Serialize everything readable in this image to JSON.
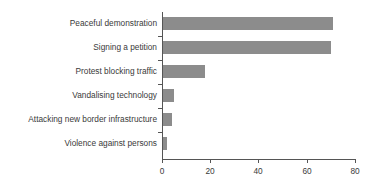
{
  "chart_data": {
    "type": "bar",
    "orientation": "horizontal",
    "title": "",
    "subtitle": "",
    "xlabel": "",
    "ylabel": "",
    "categories": [
      "Peaceful demonstration",
      "Signing a petition",
      "Protest blocking traffic",
      "Vandalising technology",
      "Attacking new border infrastructure",
      "Violence against persons"
    ],
    "values": [
      71,
      70,
      18,
      5,
      4,
      2
    ],
    "xlim": [
      0,
      80
    ],
    "xticks": [
      0,
      20,
      40,
      60,
      80
    ],
    "xtick_labels": [
      "0",
      "20",
      "40",
      "60",
      "80"
    ],
    "grid": false,
    "legend": null,
    "bar_color": "#8c8c8c",
    "axis_color": "#555555",
    "text_color": "#3a3a3a"
  }
}
